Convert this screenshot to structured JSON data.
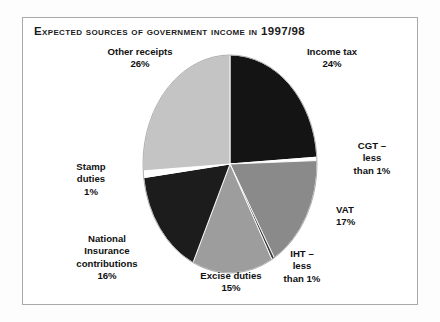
{
  "figure": {
    "title": "Expected sources of government income in 1997/98"
  },
  "chart_data": {
    "type": "pie",
    "title": "Expected sources of government income in 1997/98",
    "xlabel": "",
    "ylabel": "",
    "legend_position": "none",
    "grid": false,
    "start_angle_deg": 0,
    "direction": "clockwise",
    "labels": [
      "Income tax",
      "CGT",
      "VAT",
      "IHT",
      "Excise duties",
      "National Insurance contributions",
      "Stamp duties",
      "Other receipts"
    ],
    "values": [
      24,
      0.5,
      17,
      0.5,
      15,
      16,
      1,
      26
    ],
    "value_texts": [
      "24%",
      "less than 1%",
      "17%",
      "less than 1%",
      "15%",
      "16%",
      "1%",
      "26%"
    ],
    "colors": [
      "#141414",
      "#ffffff",
      "#8a8a8a",
      "#3b3b3b",
      "#9d9d9d",
      "#1c1c1c",
      "#ffffff",
      "#c4c4c4"
    ],
    "slices": [
      {
        "name": "income-tax",
        "label": "Income tax",
        "value": 24,
        "value_text": "24%",
        "color": "#141414"
      },
      {
        "name": "cgt",
        "label": "CGT",
        "value": 0.5,
        "value_text": "less than 1%",
        "color": "#ffffff"
      },
      {
        "name": "vat",
        "label": "VAT",
        "value": 17,
        "value_text": "17%",
        "color": "#8a8a8a"
      },
      {
        "name": "iht",
        "label": "IHT",
        "value": 0.5,
        "value_text": "less than 1%",
        "color": "#3b3b3b"
      },
      {
        "name": "excise-duties",
        "label": "Excise duties",
        "value": 15,
        "value_text": "15%",
        "color": "#9d9d9d"
      },
      {
        "name": "nic",
        "label": "National Insurance contributions",
        "value": 16,
        "value_text": "16%",
        "color": "#1c1c1c"
      },
      {
        "name": "stamp-duties",
        "label": "Stamp duties",
        "value": 1,
        "value_text": "1%",
        "color": "#ffffff"
      },
      {
        "name": "other-receipts",
        "label": "Other receipts",
        "value": 26,
        "value_text": "26%",
        "color": "#c4c4c4"
      }
    ]
  },
  "labels": {
    "other_receipts": "Other receipts\n26%",
    "income_tax": "Income tax\n24%",
    "cgt": "CGT –\nless\nthan 1%",
    "vat": "VAT\n17%",
    "iht": "IHT –\nless\nthan 1%",
    "excise_duties": "Excise duties\n15%",
    "national_insurance": "National\nInsurance\ncontributions\n16%",
    "stamp_duties": "Stamp\nduties\n1%"
  }
}
